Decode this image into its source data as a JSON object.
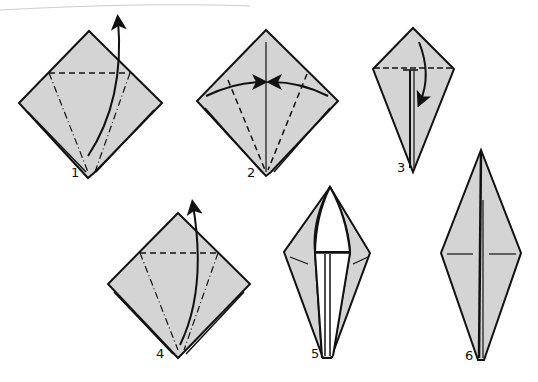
{
  "diagram": {
    "paper_color": "#d4d4d4",
    "line_color": "#111111",
    "steps": [
      {
        "number": "1",
        "description": "Square base; valley fold along dashed line, mountain folds along dash-dot lines, lift front flap upward"
      },
      {
        "number": "2",
        "description": "Valley fold both edges to the center crease"
      },
      {
        "number": "3",
        "description": "Kite shape; fold top triangle down and unfold"
      },
      {
        "number": "4",
        "description": "Petal fold: lift flap upward along creases"
      },
      {
        "number": "5",
        "description": "Elongated diamond with flap raised"
      },
      {
        "number": "6",
        "description": "Finished bird base diamond"
      }
    ]
  }
}
